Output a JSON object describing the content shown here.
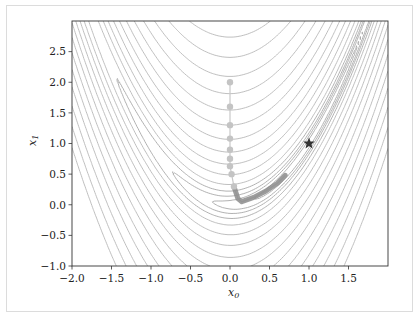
{
  "chart_data": {
    "type": "contour",
    "title": "",
    "xlabel": "x_0",
    "ylabel": "x_1",
    "xlim": [
      -2.0,
      2.0
    ],
    "ylim": [
      -1.0,
      3.0
    ],
    "xticks": [
      "−2.0",
      "−1.5",
      "−1.0",
      "−0.5",
      "0.0",
      "0.5",
      "1.0",
      "1.5"
    ],
    "yticks": [
      "−1.0",
      "−0.5",
      "0.0",
      "0.5",
      "1.0",
      "1.5",
      "2.0",
      "2.5"
    ],
    "grid": false,
    "function": "Rosenbrock (1-x0)^2 + 100(x1-x0^2)^2",
    "minimum": {
      "x": 1.0,
      "y": 1.0,
      "marker": "star"
    },
    "path": {
      "description": "optimization path starting at (0,2), descending vertically then following the valley",
      "points": [
        [
          0.0,
          2.0
        ],
        [
          0.0,
          1.6
        ],
        [
          0.0,
          1.3
        ],
        [
          0.0,
          1.08
        ],
        [
          0.0,
          0.9
        ],
        [
          0.0,
          0.75
        ],
        [
          0.0,
          0.63
        ],
        [
          0.02,
          0.5
        ],
        [
          0.05,
          0.3
        ],
        [
          0.1,
          0.1
        ],
        [
          0.15,
          0.05
        ],
        [
          0.3,
          0.12
        ],
        [
          0.45,
          0.22
        ],
        [
          0.6,
          0.35
        ],
        [
          0.7,
          0.48
        ]
      ]
    },
    "colors": {
      "contour": "#b8b8b8",
      "path": "#8c8c8c",
      "star": "#333333"
    }
  },
  "axes": {
    "xlabel": "x",
    "xlabel_sub": "0",
    "ylabel": "x",
    "ylabel_sub": "1",
    "xticks": [
      "−2.0",
      "−1.5",
      "−1.0",
      "−0.5",
      "0.0",
      "0.5",
      "1.0",
      "1.5"
    ],
    "yticks": [
      "−1.0",
      "−0.5",
      "0.0",
      "0.5",
      "1.0",
      "1.5",
      "2.0",
      "2.5"
    ]
  }
}
